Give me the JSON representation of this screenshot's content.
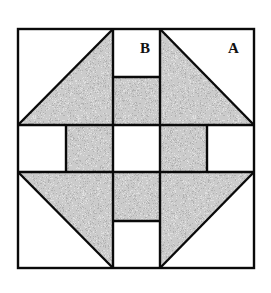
{
  "diagram": {
    "labels": {
      "b": "B",
      "a": "A"
    },
    "colors": {
      "background": "#ffffff",
      "stroke": "#0a0a0a",
      "fabric": "#8c8c8c"
    }
  }
}
